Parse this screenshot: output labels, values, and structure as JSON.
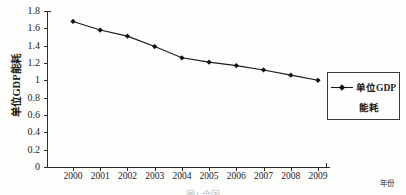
{
  "chart_data": {
    "type": "line",
    "title": "",
    "xlabel": "年份",
    "ylabel": "单位GDP能耗",
    "categories": [
      "2000",
      "2001",
      "2002",
      "2003",
      "2004",
      "2005",
      "2006",
      "2007",
      "2008",
      "2009"
    ],
    "values": [
      1.68,
      1.58,
      1.51,
      1.39,
      1.26,
      1.21,
      1.17,
      1.12,
      1.06,
      1.0
    ],
    "series": [
      {
        "name": "单位GDP能耗",
        "values": [
          1.68,
          1.58,
          1.51,
          1.39,
          1.26,
          1.21,
          1.17,
          1.12,
          1.06,
          1.0
        ]
      }
    ],
    "ylim": [
      0,
      1.8
    ],
    "yticks": [
      "0",
      "0.2",
      "0.4",
      "0.6",
      "0.8",
      "1",
      "1.2",
      "1.4",
      "1.6",
      "1.8"
    ],
    "ytick_values": [
      0,
      0.2,
      0.4,
      0.6,
      0.8,
      1.0,
      1.2,
      1.4,
      1.6,
      1.8
    ],
    "grid": false,
    "legend_position": "right",
    "line_color": "#1a1a1a",
    "marker": "diamond",
    "marker_color": "#111111"
  },
  "legend": {
    "label_line1": "单位GDP",
    "label_line2": "能耗"
  },
  "caption": {
    "text": "图1  全国"
  }
}
